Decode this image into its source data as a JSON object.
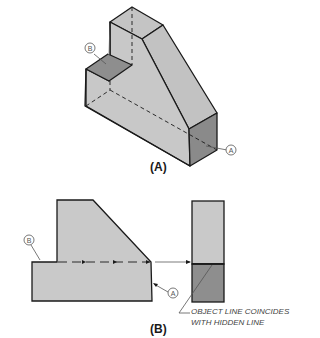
{
  "figure": {
    "part_a": {
      "caption": "(A)",
      "callouts": [
        "B",
        "A"
      ]
    },
    "part_b": {
      "caption": "(B)",
      "callouts": [
        "B",
        "A"
      ],
      "note_line1": "OBJECT LINE COINCIDES",
      "note_line2": "WITH HIDDEN LINE"
    }
  },
  "colors": {
    "face_light": "#c9c9c9",
    "face_mid": "#bdbdbd",
    "face_dark": "#8e8e8e",
    "outline": "#1a1a1a",
    "callout": "#555555"
  }
}
